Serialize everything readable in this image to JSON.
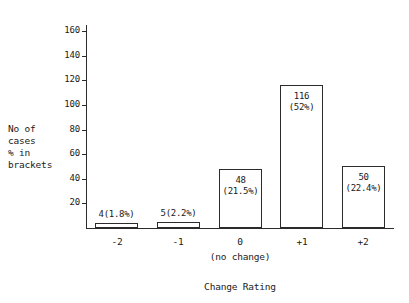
{
  "chart_data": {
    "type": "bar",
    "title": "",
    "xlabel": "Change Rating",
    "ylabel_lines": [
      "No of",
      "cases",
      "% in",
      "brackets"
    ],
    "categories": [
      "-2",
      "-1",
      "0",
      "+1",
      "+2"
    ],
    "category_sublabel": "(no change)",
    "category_sublabel_index": 2,
    "values": [
      4,
      5,
      48,
      116,
      50
    ],
    "percents": [
      "1.8%",
      "2.2%",
      "21.5%",
      "52%",
      "22.4%"
    ],
    "point_labels": [
      {
        "count": "4",
        "pct": "(1.8%)",
        "inline": "4(1.8%)",
        "inside": false
      },
      {
        "count": "5",
        "pct": "(2.2%)",
        "inline": "5(2.2%)",
        "inside": false
      },
      {
        "count": "48",
        "pct": "(21.5%)",
        "inline": "48 (21.5%)",
        "inside": true
      },
      {
        "count": "116",
        "pct": "(52%)",
        "inline": "116 (52%)",
        "inside": true
      },
      {
        "count": "50",
        "pct": "(22.4%)",
        "inline": "50 (22.4%)",
        "inside": true
      }
    ],
    "ylim": [
      0,
      165
    ],
    "ytick_values": [
      20,
      40,
      60,
      80,
      100,
      120,
      140,
      160
    ],
    "ytick_labels": [
      "20",
      "40",
      "60",
      "80",
      "100",
      "120",
      "140",
      "160"
    ],
    "grid": false,
    "legend": "none",
    "colors": {
      "axis": "#2b2b2b",
      "bar_outline": "#2b2b2b",
      "bar_fill": "#ffffff",
      "background": "#ffffff",
      "text": "#1a1a1a"
    }
  }
}
